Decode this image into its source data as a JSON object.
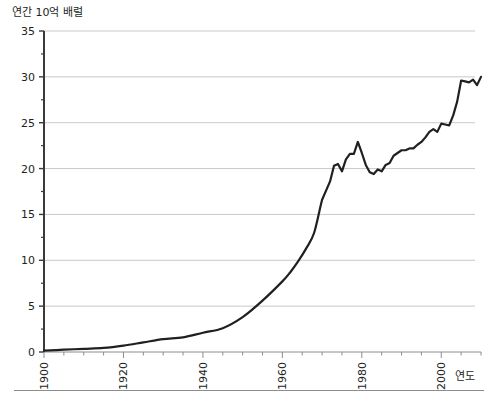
{
  "chart_data": {
    "type": "line",
    "title": "",
    "subtitle": "",
    "ylabel": "연간 10억 배럴",
    "xlabel": "연도",
    "xlim": [
      1900,
      2010
    ],
    "ylim": [
      0,
      35
    ],
    "xticks": [
      1900,
      1920,
      1940,
      1960,
      1980,
      2000
    ],
    "xtick_labels": [
      "1900",
      "1920",
      "1940",
      "1960",
      "1980",
      "2000"
    ],
    "xminor_step": 5,
    "yticks": [
      0,
      5,
      10,
      15,
      20,
      25,
      30,
      35
    ],
    "ytick_labels": [
      "0",
      "5",
      "10",
      "15",
      "20",
      "25",
      "30",
      "35"
    ],
    "yminor_step": 2.5,
    "grid": "horizontal",
    "grid_color": "#c9c9c9",
    "line_color": "#231f20",
    "line_width": 2.2,
    "legend": "none",
    "annotations": [],
    "series": [
      {
        "name": "연간 석유 생산량",
        "x": [
          1900,
          1905,
          1910,
          1915,
          1920,
          1925,
          1930,
          1935,
          1940,
          1945,
          1950,
          1955,
          1960,
          1962,
          1964,
          1966,
          1968,
          1970,
          1971,
          1972,
          1973,
          1974,
          1975,
          1976,
          1977,
          1978,
          1979,
          1980,
          1981,
          1982,
          1983,
          1984,
          1985,
          1986,
          1987,
          1988,
          1989,
          1990,
          1991,
          1992,
          1993,
          1994,
          1995,
          1996,
          1997,
          1998,
          1999,
          2000,
          2001,
          2002,
          2003,
          2004,
          2005,
          2006,
          2007,
          2008,
          2009,
          2010
        ],
        "values": [
          0.15,
          0.25,
          0.35,
          0.45,
          0.7,
          1.05,
          1.4,
          1.6,
          2.1,
          2.6,
          3.8,
          5.6,
          7.7,
          8.7,
          9.9,
          11.3,
          13.0,
          16.6,
          17.6,
          18.6,
          20.3,
          20.5,
          19.7,
          21.0,
          21.6,
          21.6,
          22.9,
          21.7,
          20.4,
          19.6,
          19.4,
          19.9,
          19.7,
          20.4,
          20.6,
          21.4,
          21.7,
          22.0,
          22.0,
          22.2,
          22.2,
          22.6,
          22.9,
          23.4,
          24.0,
          24.3,
          24.0,
          24.9,
          24.8,
          24.7,
          25.8,
          27.3,
          29.6,
          29.5,
          29.4,
          29.7,
          29.1,
          30.0
        ]
      }
    ]
  },
  "axes": {
    "y_axis_name": "연간 10억 배럴",
    "x_axis_name": "연도"
  }
}
